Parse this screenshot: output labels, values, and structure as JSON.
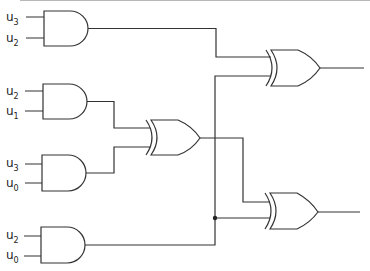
{
  "diagram": {
    "type": "logic-circuit",
    "colors": {
      "line": "#333333",
      "background": "#ffffff"
    },
    "and_gates": [
      {
        "id": "and1",
        "inputs": [
          {
            "base": "u",
            "sub": "3"
          },
          {
            "base": "u",
            "sub": "2"
          }
        ]
      },
      {
        "id": "and2",
        "inputs": [
          {
            "base": "u",
            "sub": "2"
          },
          {
            "base": "u",
            "sub": "1"
          }
        ]
      },
      {
        "id": "and3",
        "inputs": [
          {
            "base": "u",
            "sub": "3"
          },
          {
            "base": "u",
            "sub": "0"
          }
        ]
      },
      {
        "id": "and4",
        "inputs": [
          {
            "base": "u",
            "sub": "2"
          },
          {
            "base": "u",
            "sub": "0"
          }
        ]
      }
    ],
    "xor_gates": [
      {
        "id": "xor-middle",
        "inputs": [
          "and2",
          "and3"
        ]
      },
      {
        "id": "xor-top",
        "inputs": [
          "and1",
          "and4"
        ]
      },
      {
        "id": "xor-bottom",
        "inputs": [
          "xor-middle",
          "and4"
        ]
      }
    ],
    "junctions": [
      {
        "on": "and4-output",
        "feeds": "xor-bottom"
      }
    ]
  }
}
